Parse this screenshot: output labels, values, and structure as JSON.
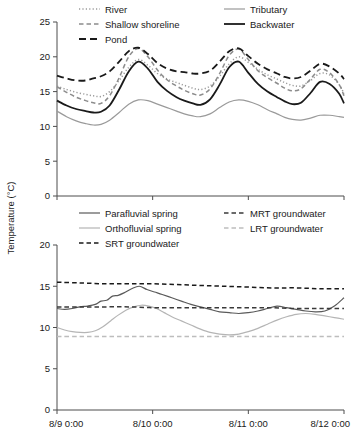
{
  "chart_data": [
    {
      "type": "line",
      "panel": "top",
      "title": "",
      "xlabel": "",
      "ylabel": "Temperature (°C)",
      "ylim": [
        0,
        25
      ],
      "yticks": [
        0,
        5,
        10,
        15,
        20,
        25
      ],
      "xlim": [
        0,
        3
      ],
      "xticks": [
        0,
        1,
        2,
        3
      ],
      "xticklabels": [
        "8/9 0:00",
        "8/10 0:00",
        "8/11 0:00",
        "8/12 0:00"
      ],
      "grid": false,
      "legend_position": "top",
      "series": [
        {
          "name": "River",
          "style": "dotted",
          "color": "#9a9a9a",
          "x": [
            0.0,
            0.1,
            0.2,
            0.3,
            0.38,
            0.46,
            0.55,
            0.65,
            0.75,
            0.85,
            0.95,
            1.05,
            1.15,
            1.25,
            1.33,
            1.42,
            1.5,
            1.6,
            1.7,
            1.8,
            1.9,
            2.0,
            2.1,
            2.2,
            2.3,
            2.38,
            2.46,
            2.55,
            2.65,
            2.75,
            2.85,
            2.95,
            3.0
          ],
          "values": [
            15.8,
            15.3,
            14.9,
            14.6,
            14.4,
            14.3,
            15.0,
            16.6,
            18.5,
            19.6,
            18.8,
            17.6,
            16.8,
            16.3,
            15.9,
            15.5,
            15.3,
            15.8,
            17.2,
            19.0,
            20.0,
            19.2,
            18.2,
            17.4,
            16.8,
            16.3,
            15.9,
            15.8,
            16.6,
            17.6,
            17.4,
            16.0,
            14.7
          ]
        },
        {
          "name": "Shallow shoreline",
          "style": "dashed",
          "color": "#8c8c8c",
          "x": [
            0.0,
            0.1,
            0.2,
            0.3,
            0.38,
            0.46,
            0.55,
            0.65,
            0.75,
            0.85,
            0.95,
            1.05,
            1.15,
            1.25,
            1.33,
            1.42,
            1.5,
            1.6,
            1.7,
            1.8,
            1.9,
            2.0,
            2.1,
            2.2,
            2.3,
            2.38,
            2.46,
            2.55,
            2.65,
            2.75,
            2.85,
            2.95,
            3.0
          ],
          "values": [
            15.7,
            14.9,
            14.2,
            13.7,
            13.4,
            13.3,
            14.4,
            17.0,
            20.0,
            21.2,
            20.0,
            18.1,
            16.7,
            15.8,
            15.2,
            14.7,
            14.5,
            15.4,
            17.6,
            20.2,
            21.1,
            19.6,
            18.0,
            17.0,
            16.2,
            15.5,
            15.1,
            15.4,
            16.8,
            18.2,
            17.7,
            16.0,
            14.4
          ]
        },
        {
          "name": "Pond",
          "style": "longdash",
          "color": "#1a1a1a",
          "x": [
            0.0,
            0.1,
            0.2,
            0.3,
            0.38,
            0.46,
            0.55,
            0.65,
            0.75,
            0.85,
            0.95,
            1.05,
            1.15,
            1.25,
            1.33,
            1.42,
            1.5,
            1.6,
            1.7,
            1.8,
            1.9,
            2.0,
            2.1,
            2.2,
            2.3,
            2.38,
            2.46,
            2.55,
            2.65,
            2.75,
            2.85,
            2.95,
            3.0
          ],
          "values": [
            17.3,
            16.9,
            16.6,
            16.6,
            16.9,
            17.2,
            17.9,
            19.3,
            20.8,
            21.3,
            20.4,
            19.1,
            18.3,
            17.9,
            17.8,
            17.6,
            17.6,
            18.0,
            19.3,
            20.8,
            21.2,
            20.1,
            19.0,
            18.2,
            17.6,
            17.1,
            16.9,
            17.1,
            18.0,
            19.0,
            18.6,
            17.6,
            16.8
          ]
        },
        {
          "name": "Tributary",
          "style": "solid",
          "color": "#9a9a9a",
          "x": [
            0.0,
            0.1,
            0.2,
            0.3,
            0.38,
            0.46,
            0.55,
            0.65,
            0.75,
            0.85,
            0.95,
            1.05,
            1.15,
            1.25,
            1.33,
            1.42,
            1.5,
            1.6,
            1.7,
            1.8,
            1.9,
            2.0,
            2.1,
            2.2,
            2.3,
            2.38,
            2.46,
            2.55,
            2.65,
            2.75,
            2.85,
            2.95,
            3.0
          ],
          "values": [
            12.2,
            11.4,
            10.8,
            10.4,
            10.2,
            10.3,
            10.9,
            12.0,
            13.2,
            13.8,
            13.7,
            13.2,
            12.7,
            12.2,
            11.8,
            11.5,
            11.4,
            11.8,
            12.7,
            13.5,
            13.8,
            13.6,
            13.1,
            12.4,
            11.8,
            11.3,
            11.0,
            10.9,
            11.2,
            11.6,
            11.6,
            11.4,
            11.3
          ]
        },
        {
          "name": "Backwater",
          "style": "solid",
          "color": "#1a1a1a",
          "x": [
            0.0,
            0.1,
            0.2,
            0.3,
            0.38,
            0.46,
            0.55,
            0.65,
            0.75,
            0.85,
            0.95,
            1.05,
            1.15,
            1.25,
            1.33,
            1.42,
            1.5,
            1.6,
            1.7,
            1.8,
            1.9,
            2.0,
            2.1,
            2.2,
            2.3,
            2.38,
            2.46,
            2.55,
            2.65,
            2.75,
            2.85,
            2.95,
            3.0
          ],
          "values": [
            13.7,
            13.0,
            12.5,
            12.2,
            12.0,
            12.1,
            13.0,
            15.3,
            17.9,
            19.3,
            18.3,
            16.4,
            15.1,
            14.2,
            13.7,
            13.3,
            13.1,
            13.9,
            16.0,
            18.5,
            19.3,
            17.7,
            16.1,
            15.0,
            14.2,
            13.6,
            13.2,
            13.4,
            14.8,
            16.4,
            16.1,
            14.7,
            13.3
          ]
        }
      ]
    },
    {
      "type": "line",
      "panel": "bottom",
      "title": "",
      "xlabel": "",
      "ylabel": "Temperature (°C)",
      "ylim": [
        0,
        20
      ],
      "yticks": [
        0,
        5,
        10,
        15,
        20
      ],
      "xlim": [
        0,
        3
      ],
      "xticks": [
        0,
        1,
        2,
        3
      ],
      "xticklabels": [
        "8/9 0:00",
        "8/10 0:00",
        "8/11 0:00",
        "8/12 0:00"
      ],
      "grid": false,
      "legend_position": "top",
      "series": [
        {
          "name": "Parafluvial spring",
          "style": "solid",
          "color": "#5a5a5a",
          "x": [
            0.0,
            0.08,
            0.16,
            0.24,
            0.32,
            0.4,
            0.46,
            0.52,
            0.58,
            0.64,
            0.7,
            0.78,
            0.86,
            0.94,
            1.02,
            1.1,
            1.2,
            1.3,
            1.4,
            1.5,
            1.6,
            1.7,
            1.8,
            1.9,
            2.0,
            2.1,
            2.2,
            2.3,
            2.4,
            2.5,
            2.6,
            2.7,
            2.8,
            2.9,
            3.0
          ],
          "values": [
            12.3,
            12.2,
            12.3,
            12.5,
            12.6,
            12.8,
            13.2,
            13.3,
            13.8,
            13.9,
            14.2,
            14.7,
            15.0,
            14.6,
            14.3,
            14.0,
            13.6,
            13.2,
            12.8,
            12.5,
            12.2,
            11.9,
            11.8,
            11.7,
            11.8,
            12.0,
            12.3,
            12.6,
            12.4,
            12.2,
            12.0,
            11.9,
            12.0,
            12.6,
            13.6
          ]
        },
        {
          "name": "Orthofluvial spring",
          "style": "solid",
          "color": "#b5b5b5",
          "x": [
            0.0,
            0.08,
            0.16,
            0.24,
            0.32,
            0.4,
            0.48,
            0.56,
            0.64,
            0.72,
            0.8,
            0.88,
            0.96,
            1.04,
            1.12,
            1.2,
            1.3,
            1.4,
            1.5,
            1.6,
            1.7,
            1.8,
            1.9,
            2.0,
            2.1,
            2.2,
            2.3,
            2.4,
            2.5,
            2.6,
            2.7,
            2.8,
            2.9,
            3.0
          ],
          "values": [
            10.0,
            9.7,
            9.5,
            9.4,
            9.4,
            9.6,
            10.1,
            10.8,
            11.5,
            12.1,
            12.5,
            12.7,
            12.6,
            12.3,
            11.8,
            11.3,
            10.8,
            10.3,
            9.8,
            9.4,
            9.2,
            9.1,
            9.2,
            9.5,
            9.9,
            10.4,
            10.9,
            11.3,
            11.6,
            11.7,
            11.6,
            11.4,
            11.2,
            11.0
          ]
        },
        {
          "name": "SRT groundwater",
          "style": "dashed",
          "color": "#1a1a1a",
          "x": [
            0.0,
            0.25,
            0.5,
            0.75,
            1.0,
            1.25,
            1.5,
            1.75,
            2.0,
            2.25,
            2.5,
            2.75,
            3.0
          ],
          "values": [
            15.5,
            15.4,
            15.3,
            15.3,
            15.3,
            15.2,
            15.1,
            15.0,
            14.9,
            14.8,
            14.8,
            14.7,
            14.7
          ]
        },
        {
          "name": "MRT groundwater",
          "style": "dashed",
          "color": "#3a3a3a",
          "x": [
            0.0,
            0.25,
            0.5,
            0.75,
            1.0,
            1.25,
            1.5,
            1.75,
            2.0,
            2.25,
            2.5,
            2.75,
            3.0
          ],
          "values": [
            12.5,
            12.5,
            12.5,
            12.5,
            12.4,
            12.4,
            12.4,
            12.4,
            12.4,
            12.4,
            12.3,
            12.3,
            12.3
          ]
        },
        {
          "name": "LRT groundwater",
          "style": "dashed",
          "color": "#bdbdbd",
          "x": [
            0.0,
            0.25,
            0.5,
            0.75,
            1.0,
            1.25,
            1.5,
            1.75,
            2.0,
            2.25,
            2.5,
            2.75,
            3.0
          ],
          "values": [
            8.9,
            8.9,
            8.9,
            8.9,
            8.9,
            8.9,
            8.9,
            8.9,
            8.9,
            8.9,
            8.9,
            8.9,
            8.9
          ]
        }
      ]
    }
  ],
  "figure": {
    "y_axis_title": "Temperature (°C)",
    "top_panel": {
      "yticklabels": [
        "25",
        "20",
        "15",
        "10",
        "5",
        "0"
      ],
      "legend": [
        {
          "label": "River",
          "style": "dotted",
          "color": "#9a9a9a"
        },
        {
          "label": "Shallow shoreline",
          "style": "dashed",
          "color": "#8c8c8c"
        },
        {
          "label": "Pond",
          "style": "longdash",
          "color": "#1a1a1a"
        },
        {
          "label": "Tributary",
          "style": "solid",
          "color": "#9a9a9a"
        },
        {
          "label": "Backwater",
          "style": "solid",
          "color": "#1a1a1a"
        }
      ]
    },
    "bottom_panel": {
      "yticklabels": [
        "20",
        "15",
        "10",
        "5",
        "0"
      ],
      "legend": [
        {
          "label": "Parafluvial spring",
          "style": "solid",
          "color": "#5a5a5a"
        },
        {
          "label": "Orthofluvial spring",
          "style": "solid",
          "color": "#b5b5b5"
        },
        {
          "label": "SRT groundwater",
          "style": "dashed",
          "color": "#1a1a1a"
        },
        {
          "label": "MRT groundwater",
          "style": "dashed",
          "color": "#3a3a3a"
        },
        {
          "label": "LRT groundwater",
          "style": "dashed",
          "color": "#bdbdbd"
        }
      ]
    },
    "xticklabels": [
      "8/9 0:00",
      "8/10 0:00",
      "8/11 0:00",
      "8/12 0:00"
    ]
  }
}
